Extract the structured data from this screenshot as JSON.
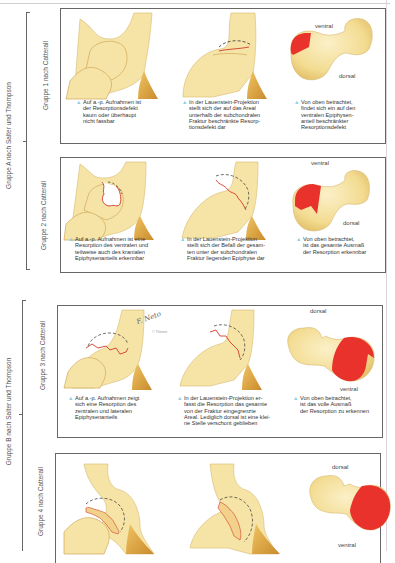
{
  "outer_groups": [
    {
      "label": "Gruppe A nach Salter und Thompson"
    },
    {
      "label": "Gruppe B nach Salter und Thompson"
    }
  ],
  "panels": [
    {
      "group_label": "Gruppe 1 nach Catterall",
      "captions": [
        "Auf a.-p. Aufnahmen ist der Resorptionsdefekt kaum oder überhaupt nicht fassbar",
        "In der Lauenstein-Projektion stellt sich der auf das Areal unterhalb der subchondralen Fraktur beschränkte Resorptionsdefekt dar",
        "Von oben betrachtet, findet sich ein auf den ventralen Epiphysenanteil beschränkter Resorptionsdefekt"
      ],
      "caption_lines": [
        [
          "Auf a.-p. Aufnahmen ist",
          "der Resorptionsdefekt",
          "kaum oder überhaupt",
          "nicht fassbar"
        ],
        [
          "In der Lauenstein-Projektion",
          "stellt sich der auf das Areal",
          "unterhalb der subchondralen",
          "Fraktur beschränkte Resorp-",
          "tionsdefekt dar"
        ],
        [
          "Von oben betrachtet,",
          "findet sich ein auf den",
          "ventralen Epiphysen-",
          "anteil beschränkter",
          "Resorptionsdefekt"
        ]
      ],
      "top_label": "ventral",
      "bottom_label": "dorsal"
    },
    {
      "group_label": "Gruppe 2 nach Catterall",
      "caption_lines": [
        [
          "Auf a.-p. Aufnahmen ist eine",
          "Resorption des ventralen und",
          "teilweise auch des kranialen",
          "Epiphysenanteils erkennbar"
        ],
        [
          "In der Lauenstein-Projektion",
          "stellt sich der Befall der gesam-",
          "ten unter der subchondralen",
          "Fraktur liegenden Epiphyse dar"
        ],
        [
          "Von oben betrachtet,",
          "ist das gesamte Ausmaß",
          "der Resorption erkennbar"
        ]
      ],
      "top_label": "ventral",
      "bottom_label": "dorsal"
    },
    {
      "group_label": "Gruppe 3 nach Catterall",
      "caption_lines": [
        [
          "Auf a.-p. Aufnahmen zeigt",
          "sich eine Resorption des",
          "zentralen und lateralen",
          "Epiphysenanteils"
        ],
        [
          "In der Lauenstein-Projektion er-",
          "fasst die Resorption das gesamte",
          "von der Fraktur eingegrenzte",
          "Areal. Lediglich dorsal ist eine klei-",
          "ne Stelle verschont geblieben"
        ],
        [
          "Von oben betrachtet,",
          "ist das volle Ausmaß",
          "der Resorption zu erkennen"
        ]
      ],
      "top_label": "dorsal",
      "bottom_label": "ventral",
      "signature": "F. Neto",
      "copyright": "© Thieme"
    },
    {
      "group_label": "Gruppe 4 nach Catterall",
      "top_label": "dorsal",
      "bottom_label": "ventral"
    }
  ],
  "colors": {
    "bone": "#f6e4a6",
    "bone_shade": "#e9c86f",
    "bone_dark": "#d9a24a",
    "resorption": "#e8322b",
    "bullet": "#8fd0e6",
    "border": "#666666"
  }
}
